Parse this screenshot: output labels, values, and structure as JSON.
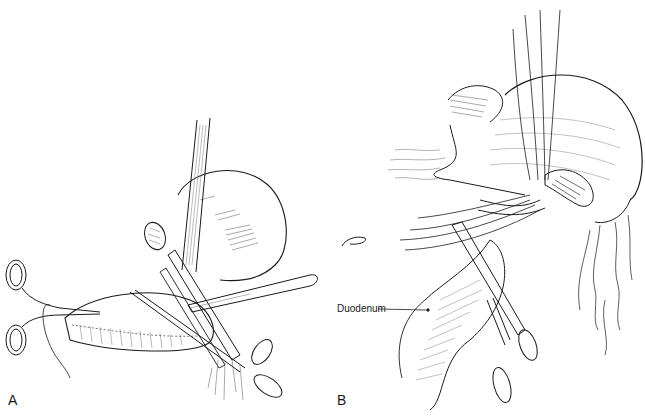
{
  "figure": {
    "panels": [
      {
        "id": "A",
        "label": "A",
        "description": "Stomach held with clamps; straight crushing clamp applied across antrum with scalpel dividing tissue; ring forceps on left"
      },
      {
        "id": "B",
        "label": "B",
        "description": "Stomach with sutures placed through duodenal stump; hemostat clamp on duodenum; omental vessels hanging below"
      }
    ],
    "annotations": [
      {
        "text": "Duodenum",
        "panel": "B"
      }
    ],
    "colors": {
      "ink": "#1a1a1a",
      "background": "#ffffff"
    }
  }
}
